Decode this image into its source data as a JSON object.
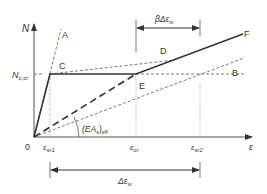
{
  "diagram": {
    "axes": {
      "y_label": "N",
      "x_label": "ε",
      "origin_label": "0"
    },
    "levels": {
      "n_cr_label": "N",
      "n_cr_sub": "c,cr"
    },
    "points": {
      "A": "A",
      "B": "B",
      "C": "C",
      "D": "D",
      "E": "E",
      "F": "F"
    },
    "x_ticks": [
      {
        "label": "ε",
        "sub": "sr1"
      },
      {
        "label": "ε",
        "sub": "cr"
      },
      {
        "label": "ε",
        "sub": "sr2"
      }
    ],
    "stiffness_label": "(EA",
    "stiffness_sub1": "s",
    "stiffness_close": ")",
    "stiffness_sub2": "eff",
    "beta_dimension": {
      "prefix": "βΔε",
      "sub": "sr"
    },
    "delta_dimension": {
      "prefix": "Δε",
      "sub": "sr"
    },
    "colors": {
      "line": "#333333",
      "dashed": "#555555",
      "dotted": "#888888"
    }
  }
}
